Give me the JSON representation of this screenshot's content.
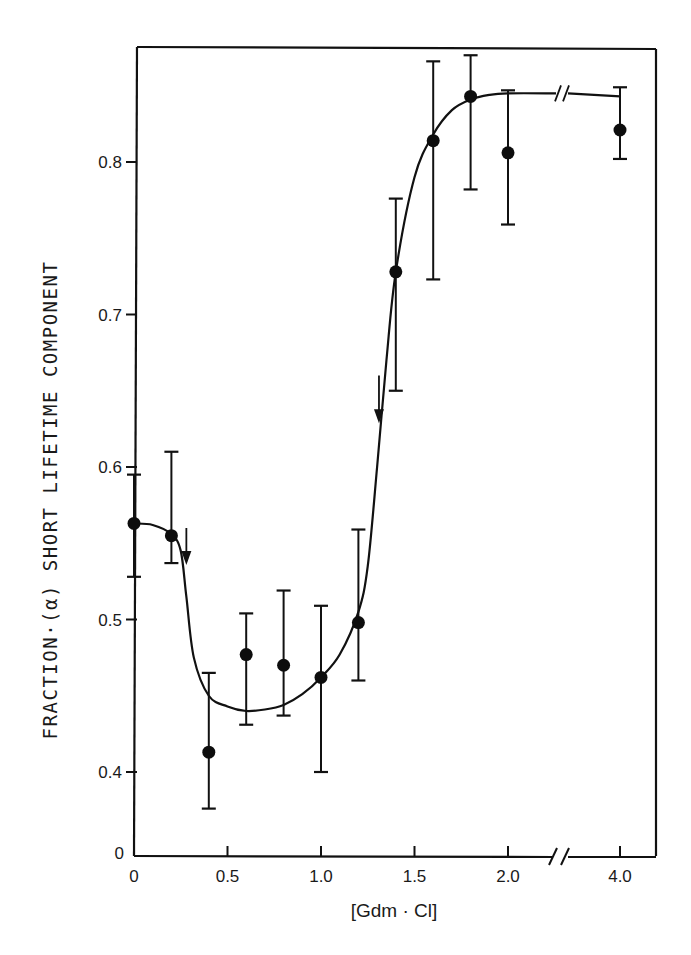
{
  "chart_data": {
    "type": "scatter",
    "title": "",
    "xlabel": "[Gdm · Cl]",
    "ylabel": "FRACTION·(α) SHORT LIFETIME COMPONENT",
    "xlim": [
      0,
      4.0
    ],
    "ylim": [
      0,
      0.87
    ],
    "x_axis_break": {
      "between": [
        2.0,
        4.0
      ]
    },
    "y_axis_break": {
      "between": [
        0,
        0.4
      ]
    },
    "x_ticks": [
      {
        "value": 0,
        "label": "0"
      },
      {
        "value": 0.5,
        "label": "0.5"
      },
      {
        "value": 1.0,
        "label": "1.0"
      },
      {
        "value": 1.5,
        "label": "1.5"
      },
      {
        "value": 2.0,
        "label": "2.0"
      },
      {
        "value": 4.0,
        "label": "4.0"
      }
    ],
    "y_ticks": [
      {
        "value": 0,
        "label": "0"
      },
      {
        "value": 0.4,
        "label": "0.4"
      },
      {
        "value": 0.5,
        "label": "0.5"
      },
      {
        "value": 0.6,
        "label": "0.6"
      },
      {
        "value": 0.7,
        "label": "0.7"
      },
      {
        "value": 0.8,
        "label": "0.8"
      }
    ],
    "grid": false,
    "legend": null,
    "series": [
      {
        "name": "measured fraction",
        "marker": "filled-circle",
        "x": [
          0.0,
          0.2,
          0.4,
          0.6,
          0.8,
          1.0,
          1.2,
          1.4,
          1.6,
          1.8,
          2.0,
          4.0
        ],
        "y": [
          0.563,
          0.555,
          0.413,
          0.477,
          0.47,
          0.462,
          0.498,
          0.728,
          0.814,
          0.843,
          0.806,
          0.821
        ],
        "err_high": [
          0.595,
          0.61,
          0.465,
          0.504,
          0.519,
          0.509,
          0.559,
          0.776,
          0.866,
          0.87,
          0.847,
          0.849
        ],
        "err_low": [
          0.528,
          0.537,
          0.376,
          0.431,
          0.437,
          0.4,
          0.46,
          0.65,
          0.723,
          0.782,
          0.759,
          0.802
        ]
      },
      {
        "name": "fitted curve",
        "style": "smooth-line",
        "x": [
          0.0,
          0.1,
          0.2,
          0.25,
          0.28,
          0.32,
          0.4,
          0.5,
          0.6,
          0.7,
          0.8,
          0.9,
          1.0,
          1.1,
          1.2,
          1.25,
          1.3,
          1.35,
          1.4,
          1.5,
          1.6,
          1.7,
          1.8,
          1.9,
          2.0,
          2.2,
          4.0
        ],
        "y": [
          0.563,
          0.562,
          0.556,
          0.545,
          0.515,
          0.475,
          0.45,
          0.443,
          0.44,
          0.441,
          0.444,
          0.451,
          0.462,
          0.477,
          0.505,
          0.535,
          0.6,
          0.67,
          0.728,
          0.79,
          0.818,
          0.834,
          0.841,
          0.844,
          0.845,
          0.845,
          0.843
        ]
      }
    ],
    "annotations": [
      {
        "type": "arrow-down",
        "x": 0.28,
        "y_from": 0.56,
        "y_to": 0.537,
        "description": "transition marker"
      },
      {
        "type": "arrow-down",
        "x": 1.31,
        "y_from": 0.66,
        "y_to": 0.63,
        "description": "transition marker"
      }
    ]
  },
  "labels": {
    "ylabel": "FRACTION·(α) SHORT LIFETIME COMPONENT",
    "xlabel": "[Gdm · Cl]"
  }
}
